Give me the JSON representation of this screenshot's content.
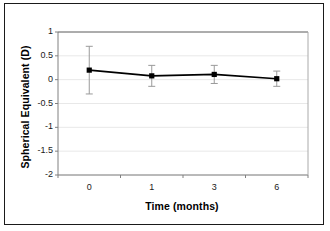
{
  "chart_data": {
    "type": "line",
    "title": "",
    "xlabel": "Time (months)",
    "ylabel": "Spherical Equivalent (D)",
    "categories": [
      "0",
      "1",
      "3",
      "6"
    ],
    "values": [
      0.2,
      0.08,
      0.11,
      0.02
    ],
    "errors": [
      0.5,
      0.22,
      0.19,
      0.16
    ],
    "error_upper": [
      0.7,
      0.3,
      0.3,
      0.18
    ],
    "error_lower": [
      -0.3,
      -0.14,
      -0.08,
      -0.14
    ],
    "ylim": [
      -2,
      1
    ],
    "yticks": [
      1,
      0.5,
      0,
      -0.5,
      -1,
      -1.5,
      -2
    ],
    "ytick_labels": [
      "1",
      "0.5",
      "0",
      "-0.5",
      "-1",
      "-1.5",
      "-2"
    ],
    "xtick_labels": [
      "0",
      "1",
      "3",
      "6"
    ],
    "grid": true,
    "legend": false,
    "marker": "square",
    "series_color": "#000000",
    "axis_color": "#808080",
    "grid_color": "#e8e8e8",
    "error_bar_color": "#9a9a9a",
    "frame_color": "#1a1a1a"
  },
  "figure": {
    "background": "#ffffff"
  }
}
